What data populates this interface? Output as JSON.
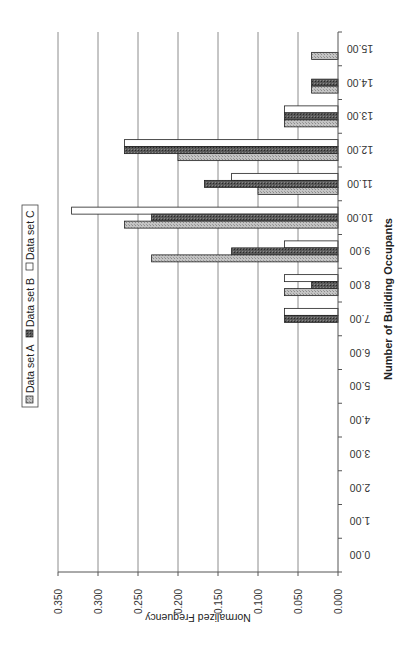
{
  "chart_data": {
    "type": "bar",
    "orientation_note": "figure rotated 90 degrees clockwise",
    "title": "",
    "xlabel": "Number of Building Occupants",
    "ylabel": "Normalized Frequency",
    "ylim": [
      0,
      0.35
    ],
    "yticks": [
      "0.000",
      "0.050",
      "0.100",
      "0.150",
      "0.200",
      "0.250",
      "0.300",
      "0.350"
    ],
    "grid": true,
    "legend_position": "top",
    "categories": [
      "0.00",
      "1.00",
      "2.00",
      "3.00",
      "4.00",
      "5.00",
      "6.00",
      "7.00",
      "8.00",
      "9.00",
      "10.00",
      "11.00",
      "12.00",
      "13.00",
      "14.00",
      "15.00"
    ],
    "series": [
      {
        "name": "Data set A",
        "color": "#b8b8b8",
        "values": [
          0,
          0,
          0,
          0,
          0,
          0,
          0,
          0,
          0.067,
          0.233,
          0.267,
          0.1,
          0.2,
          0.067,
          0.033,
          0.033
        ]
      },
      {
        "name": "Data set B",
        "color": "#555555",
        "values": [
          0,
          0,
          0,
          0,
          0,
          0,
          0,
          0.067,
          0.033,
          0.133,
          0.233,
          0.167,
          0.267,
          0.067,
          0.033,
          0
        ]
      },
      {
        "name": "Data set C",
        "color": "#ffffff",
        "values": [
          0,
          0,
          0,
          0,
          0,
          0,
          0,
          0.067,
          0.067,
          0.067,
          0.333,
          0.133,
          0.267,
          0.067,
          0,
          0
        ]
      }
    ]
  }
}
